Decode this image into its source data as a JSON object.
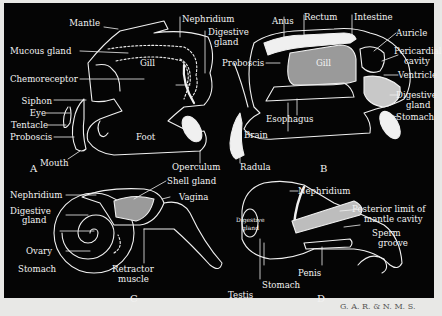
{
  "figure": {
    "panels": [
      {
        "id": "A",
        "label": "A",
        "labels": [
          "Mantle",
          "Mucous gland",
          "Chemoreceptor",
          "Siphon",
          "Eye",
          "Tentacle",
          "Proboscis",
          "Mouth",
          "Nephridium",
          "Digestive gland",
          "Gill",
          "Foot",
          "Operculum"
        ]
      },
      {
        "id": "B",
        "label": "B",
        "labels": [
          "Anus",
          "Rectum",
          "Intestine",
          "Auricle",
          "Pericardial cavity",
          "Ventricle",
          "Digestive gland",
          "Stomach",
          "Proboscis",
          "Gill",
          "Esophagus",
          "Brain",
          "Radula"
        ]
      },
      {
        "id": "C",
        "label": "C",
        "labels": [
          "Nephridium",
          "Digestive gland",
          "Ovary",
          "Stomach",
          "Shell gland",
          "Vagina",
          "Retractor muscle"
        ]
      },
      {
        "id": "D",
        "label": "D",
        "labels": [
          "Nephridium",
          "Posterior limit of mantle cavity",
          "Sperm groove",
          "Digestive gland",
          "Penis",
          "Stomach",
          "Testis"
        ]
      }
    ],
    "a": {
      "mantle": "Mantle",
      "mucous_gland": "Mucous gland",
      "chemoreceptor": "Chemoreceptor",
      "siphon": "Siphon",
      "eye": "Eye",
      "tentacle": "Tentacle",
      "proboscis": "Proboscis",
      "mouth": "Mouth",
      "nephridium": "Nephridium",
      "digestive": "Digestive",
      "gland": "gland",
      "gill": "Gill",
      "foot": "Foot",
      "operculum": "Operculum",
      "panel": "A"
    },
    "b": {
      "anus": "Anus",
      "rectum": "Rectum",
      "intestine": "Intestine",
      "auricle": "Auricle",
      "pericardial": "Pericardial",
      "cavity": "cavity",
      "ventricle": "Ventricle",
      "digestive": "Digestive",
      "gland": "gland",
      "stomach": "Stomach",
      "proboscis": "Proboscis",
      "gill": "Gill",
      "esophagus": "Esophagus",
      "brain": "Brain",
      "radula": "Radula",
      "panel": "B"
    },
    "c": {
      "nephridium": "Nephridium",
      "digestive": "Digestive",
      "gland": "gland",
      "ovary": "Ovary",
      "stomach": "Stomach",
      "shell_gland": "Shell gland",
      "vagina": "Vagina",
      "retractor": "Retractor",
      "muscle": "muscle",
      "panel": "C"
    },
    "d": {
      "nephridium": "Nephridium",
      "posterior": "Posterior limit of",
      "mantle_cavity": "mantle cavity",
      "sperm": "Sperm",
      "groove": "groove",
      "digestive": "Digestive",
      "gland": "gland",
      "penis": "Penis",
      "stomach": "Stomach",
      "testis": "Testis",
      "panel": "D"
    },
    "credit": "G. A. R. & N. M. S."
  },
  "colors": {
    "background": "#050505",
    "line": "#f2f2f2",
    "margin": "#e8e8e6"
  }
}
